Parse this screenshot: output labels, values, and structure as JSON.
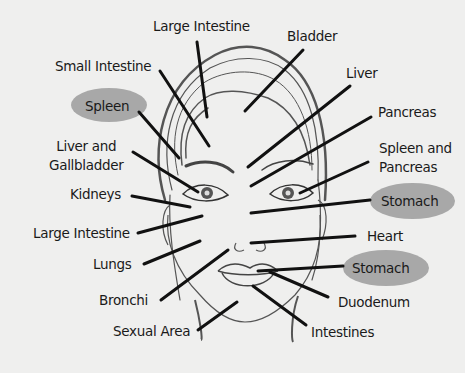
{
  "colors": {
    "background": "#efefee",
    "line": "#111111",
    "face_outline": "#555555",
    "highlight": "#a8a8a8"
  },
  "labels": [
    {
      "id": "large-intestine-top",
      "text": "Large Intestine",
      "highlighted": false
    },
    {
      "id": "bladder",
      "text": "Bladder",
      "highlighted": false
    },
    {
      "id": "small-intestine",
      "text": "Small Intestine",
      "highlighted": false
    },
    {
      "id": "liver",
      "text": "Liver",
      "highlighted": false
    },
    {
      "id": "spleen",
      "text": "Spleen",
      "highlighted": true
    },
    {
      "id": "pancreas",
      "text": "Pancreas",
      "highlighted": false
    },
    {
      "id": "liver-gallbladder",
      "text": "Liver and\nGallbladder",
      "highlighted": false
    },
    {
      "id": "spleen-pancreas",
      "text": "Spleen and\nPancreas",
      "highlighted": false
    },
    {
      "id": "kidneys",
      "text": "Kidneys",
      "highlighted": false
    },
    {
      "id": "stomach-upper",
      "text": "Stomach",
      "highlighted": true
    },
    {
      "id": "large-intestine-cheek",
      "text": "Large Intestine",
      "highlighted": false
    },
    {
      "id": "heart",
      "text": "Heart",
      "highlighted": false
    },
    {
      "id": "lungs",
      "text": "Lungs",
      "highlighted": false
    },
    {
      "id": "stomach-lower",
      "text": "Stomach",
      "highlighted": true
    },
    {
      "id": "bronchi",
      "text": "Bronchi",
      "highlighted": false
    },
    {
      "id": "duodenum",
      "text": "Duodenum",
      "highlighted": false
    },
    {
      "id": "sexual-area",
      "text": "Sexual Area",
      "highlighted": false
    },
    {
      "id": "intestines",
      "text": "Intestines",
      "highlighted": false
    }
  ]
}
